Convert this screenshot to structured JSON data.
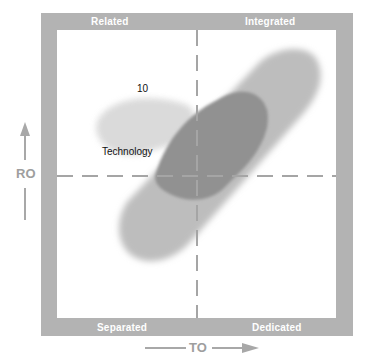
{
  "quadrants": {
    "top_left": "Related",
    "top_right": "Integrated",
    "bottom_left": "Separated",
    "bottom_right": "Dedicated"
  },
  "axes": {
    "x_label": "TO",
    "y_label": "RO"
  },
  "annotations": {
    "number": "10",
    "category": "Technology"
  },
  "colors": {
    "frame": "#b3b3b3",
    "blob_light": "#c4c4c4",
    "blob_dark": "#8f8f8f",
    "dashes": "#aaaaaa",
    "axis_text": "#9e9e9e"
  }
}
